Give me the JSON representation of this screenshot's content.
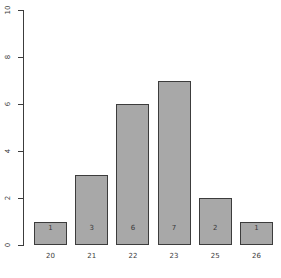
{
  "chart_data": {
    "type": "bar",
    "title": "",
    "subtitle": "",
    "xlabel": "",
    "ylabel": "",
    "categories": [
      "20",
      "21",
      "22",
      "23",
      "25",
      "26"
    ],
    "values": [
      1,
      3,
      6,
      7,
      2,
      1
    ],
    "bar_labels": [
      "1",
      "3",
      "6",
      "7",
      "2",
      "1"
    ],
    "ylim": [
      0,
      10
    ],
    "y_ticks": [
      "0",
      "2",
      "4",
      "6",
      "8",
      "10"
    ],
    "y_tick_values": [
      0,
      2,
      4,
      6,
      8,
      10
    ],
    "grid": false,
    "legend": false,
    "legend_position": "none",
    "annotations": [],
    "colors": {
      "background": "#ffffff",
      "bar_fill": "#a8a8a8",
      "bar_border": "#3c3c3c",
      "axis": "#3c3c3c",
      "text": "#3c3c3c",
      "bar_label_text": "#3a3a3a"
    }
  }
}
